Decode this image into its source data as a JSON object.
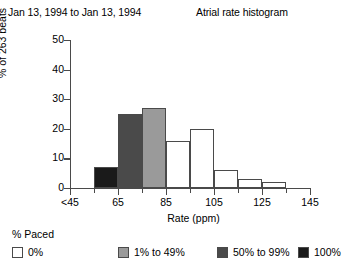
{
  "header": {
    "date_range": "Jan 13, 1994 to Jan 13, 1994",
    "title": "Atrial rate histogram"
  },
  "legend": {
    "title": "% Paced",
    "items": [
      {
        "label": "0%",
        "color": "#ffffff"
      },
      {
        "label": "1% to 49%",
        "color": "#9a9a9a"
      },
      {
        "label": "50% to 99%",
        "color": "#4a4a4a"
      },
      {
        "label": "100%",
        "color": "#1a1a1a"
      }
    ]
  },
  "chart_data": {
    "type": "bar",
    "title": "Atrial rate histogram",
    "xlabel": "Rate (ppm)",
    "ylabel": "% of 263 beats",
    "xlim": [
      45,
      145
    ],
    "ylim": [
      0,
      50
    ],
    "ytick_labels": [
      "0",
      "10",
      "20",
      "30",
      "40",
      "50"
    ],
    "ytick_values": [
      0,
      10,
      20,
      30,
      40,
      50
    ],
    "xtick_labels": [
      "<45",
      "65",
      "85",
      "105",
      "125",
      "145"
    ],
    "xtick_values": [
      45,
      65,
      85,
      105,
      125,
      145
    ],
    "grid": false,
    "legend_position": "below",
    "bin_width": 10,
    "total_beats": 263,
    "bars": [
      {
        "bin_start": 45,
        "bin_end": 55,
        "value": 0,
        "paced_group": "0%",
        "color": "#ffffff"
      },
      {
        "bin_start": 55,
        "bin_end": 65,
        "value": 7,
        "paced_group": "100%",
        "color": "#1a1a1a"
      },
      {
        "bin_start": 65,
        "bin_end": 75,
        "value": 25,
        "paced_group": "50% to 99%",
        "color": "#4a4a4a"
      },
      {
        "bin_start": 75,
        "bin_end": 85,
        "value": 27,
        "paced_group": "1% to 49%",
        "color": "#9a9a9a"
      },
      {
        "bin_start": 85,
        "bin_end": 95,
        "value": 16,
        "paced_group": "0%",
        "color": "#ffffff"
      },
      {
        "bin_start": 95,
        "bin_end": 105,
        "value": 20,
        "paced_group": "0%",
        "color": "#ffffff"
      },
      {
        "bin_start": 105,
        "bin_end": 115,
        "value": 6,
        "paced_group": "0%",
        "color": "#ffffff"
      },
      {
        "bin_start": 115,
        "bin_end": 125,
        "value": 3,
        "paced_group": "0%",
        "color": "#ffffff"
      },
      {
        "bin_start": 125,
        "bin_end": 135,
        "value": 2,
        "paced_group": "0%",
        "color": "#ffffff"
      }
    ]
  }
}
